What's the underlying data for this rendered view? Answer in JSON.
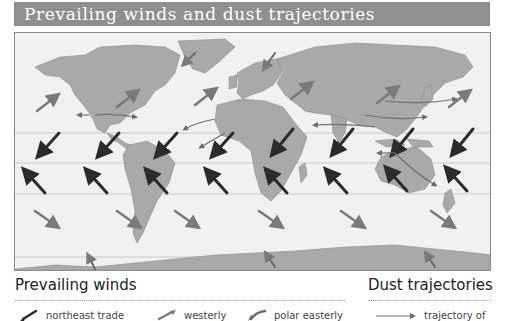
{
  "title": "Prevailing winds and dust trajectories",
  "map": {
    "land_color": "#a9a9a9",
    "ocean_color": "#f1f1f1",
    "latitude_line_color": "#c8c8c8",
    "arrow_colors": {
      "northeast_trade": "#2b2b2b",
      "southeast_trade": "#2b2b2b",
      "westerly": "#7a7a7a",
      "polar_easterly": "#6a6a6a",
      "dust_trajectory": "#6e6e6e"
    }
  },
  "legend": {
    "prevailing_winds": {
      "heading": "Prevailing winds",
      "items": [
        {
          "label": "northeast trade",
          "icon": "dark-arrow-sw"
        },
        {
          "label": "westerly",
          "icon": "gray-arrow-ne"
        },
        {
          "label": "polar easterly",
          "icon": "gray-arrow-sw"
        }
      ]
    },
    "dust_trajectories": {
      "heading": "Dust trajectories",
      "items": [
        {
          "label": "trajectory of",
          "icon": "thin-arrow-right"
        }
      ]
    }
  }
}
